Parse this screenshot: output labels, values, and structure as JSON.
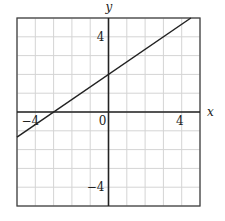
{
  "chart_data": {
    "type": "line",
    "title": "",
    "xlabel": "x",
    "ylabel": "y",
    "xlim": [
      -5,
      5
    ],
    "ylim": [
      -5,
      5
    ],
    "grid": true,
    "grid_step": 1,
    "x_tick_labels": [
      {
        "value": -4,
        "label": "−4"
      },
      {
        "value": 0,
        "label": "0"
      },
      {
        "value": 4,
        "label": "4"
      }
    ],
    "y_tick_labels": [
      {
        "value": 4,
        "label": "4"
      },
      {
        "value": -4,
        "label": "−4"
      }
    ],
    "series": [
      {
        "name": "line",
        "equation": "y = (2/3)x + 2",
        "x": [
          -5,
          4.5
        ],
        "y": [
          -1.333,
          5
        ]
      }
    ]
  },
  "colors": {
    "grid": "#d4d4d4",
    "axis": "#222222",
    "border": "#444444",
    "line": "#222222"
  }
}
